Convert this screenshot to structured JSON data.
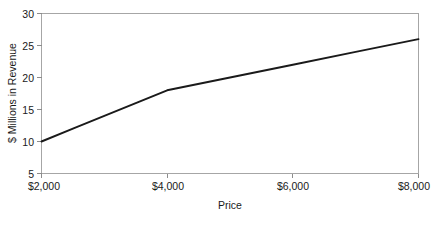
{
  "chart_data": {
    "type": "line",
    "title": "",
    "subtitle": "",
    "xlabel": "Price",
    "ylabel": "$ Millions in Revenue",
    "xlim": [
      2000,
      8000
    ],
    "ylim": [
      5,
      30
    ],
    "grid": false,
    "legend": false,
    "legend_position": "none",
    "x_tick_labels": [
      "$2,000",
      "$4,000",
      "$6,000",
      "$8,000"
    ],
    "x_tick_values": [
      2000,
      4000,
      6000,
      8000
    ],
    "y_tick_labels": [
      "5",
      "10",
      "15",
      "20",
      "25",
      "30"
    ],
    "y_tick_values": [
      5,
      10,
      15,
      20,
      25,
      30
    ],
    "x": [
      2000,
      2500,
      3000,
      3500,
      4000,
      5000,
      6000,
      7000,
      8000
    ],
    "values": [
      10.0,
      12.0,
      14.0,
      16.0,
      18.0,
      20.0,
      22.0,
      24.0,
      26.0
    ],
    "series": [
      {
        "name": "Revenue",
        "color": "#1a1a1a",
        "values": [
          10.0,
          12.0,
          14.0,
          16.0,
          18.0,
          20.0,
          22.0,
          24.0,
          26.0
        ]
      }
    ],
    "annotations": []
  },
  "axes": {
    "y_title": "$ Millions in Revenue",
    "x_title": "Price",
    "y_ticks": [
      {
        "label": "30",
        "value": 30
      },
      {
        "label": "25",
        "value": 25
      },
      {
        "label": "20",
        "value": 20
      },
      {
        "label": "15",
        "value": 15
      },
      {
        "label": "10",
        "value": 10
      },
      {
        "label": "5",
        "value": 5
      }
    ],
    "x_ticks": [
      {
        "label": "$2,000",
        "value": 2000
      },
      {
        "label": "$4,000",
        "value": 4000
      },
      {
        "label": "$6,000",
        "value": 6000
      },
      {
        "label": "$8,000",
        "value": 8000
      }
    ]
  },
  "colors": {
    "background": "#ffffff",
    "frame": "#a6a6a6",
    "tick": "#8c8c8c",
    "line": "#1a1a1a",
    "text": "#1a1a1a"
  }
}
